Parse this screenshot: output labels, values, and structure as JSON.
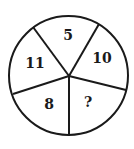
{
  "diagram": {
    "type": "number-wheel-puzzle",
    "sectors": [
      {
        "position": "top",
        "value": "5"
      },
      {
        "position": "upper-right",
        "value": "10"
      },
      {
        "position": "lower-right",
        "value": "?"
      },
      {
        "position": "lower-left",
        "value": "8"
      },
      {
        "position": "upper-left",
        "value": "11"
      }
    ],
    "colors": {
      "stroke": "#1a1a1a",
      "background": "#ffffff"
    }
  }
}
